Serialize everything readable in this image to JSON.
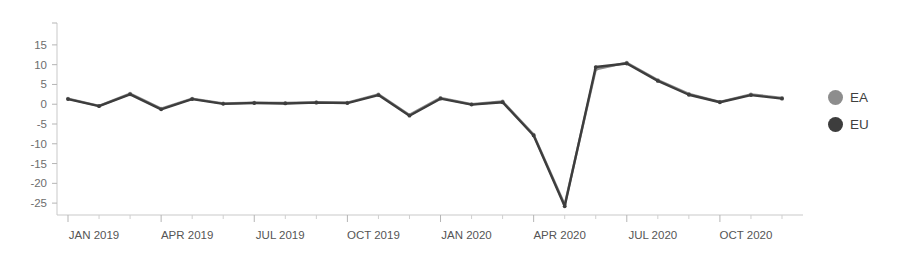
{
  "chart_data": {
    "type": "line",
    "title": "",
    "xlabel": "",
    "ylabel": "",
    "ylim": [
      -27.5,
      17.5
    ],
    "yticks": [
      15,
      10,
      5,
      0,
      -5,
      -10,
      -15,
      -20,
      -25
    ],
    "grid": false,
    "legend_position": "right",
    "x": [
      "JAN 2019",
      "FEB 2019",
      "MAR 2019",
      "APR 2019",
      "MAY 2019",
      "JUN 2019",
      "JUL 2019",
      "AUG 2019",
      "SEP 2019",
      "OCT 2019",
      "NOV 2019",
      "DEC 2019",
      "JAN 2020",
      "FEB 2020",
      "MAR 2020",
      "APR 2020",
      "MAY 2020",
      "JUN 2020",
      "JUL 2020",
      "AUG 2020",
      "SEP 2020",
      "OCT 2020",
      "NOV 2020",
      "DEC 2020"
    ],
    "xtick_labels": [
      "JAN 2019",
      "APR 2019",
      "JUL 2019",
      "OCT 2019",
      "JAN 2020",
      "APR 2020",
      "JUL 2020",
      "OCT 2020"
    ],
    "xtick_indices": [
      0,
      3,
      6,
      9,
      12,
      15,
      18,
      21
    ],
    "series": [
      {
        "name": "EA",
        "color": "#8d8d8d",
        "values": [
          1.4,
          -0.4,
          2.7,
          -1.1,
          1.4,
          0.2,
          0.4,
          0.3,
          0.5,
          0.4,
          2.5,
          -2.7,
          1.6,
          0.0,
          0.7,
          -7.7,
          -25.4,
          8.8,
          10.5,
          6.1,
          2.6,
          0.6,
          2.5,
          1.6
        ]
      },
      {
        "name": "EU",
        "color": "#3d3d3d",
        "values": [
          1.3,
          -0.5,
          2.5,
          -1.3,
          1.3,
          0.1,
          0.3,
          0.2,
          0.4,
          0.3,
          2.3,
          -2.9,
          1.4,
          -0.1,
          0.5,
          -7.9,
          -25.8,
          9.4,
          10.3,
          5.9,
          2.4,
          0.5,
          2.3,
          1.4
        ]
      }
    ]
  },
  "legend": {
    "items": [
      {
        "label": "EA",
        "color": "#8d8d8d"
      },
      {
        "label": "EU",
        "color": "#3d3d3d"
      }
    ]
  }
}
